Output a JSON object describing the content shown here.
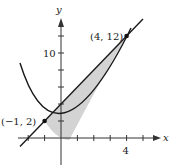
{
  "diagram": {
    "axes": {
      "x_label": "x",
      "y_label": "y"
    },
    "tick_labels": {
      "x": "4",
      "y": "10"
    },
    "points": [
      {
        "label": "(−1, 2)",
        "x": -1,
        "y": 2
      },
      {
        "label": "(4, 12)",
        "x": 4,
        "y": 12
      }
    ],
    "curves": [
      {
        "type": "parabola",
        "equation": "y = x^2 - x"
      },
      {
        "type": "line",
        "equation": "y = 2x + 4"
      }
    ],
    "shaded_region": "between line and parabola from x = -1 to x = 4",
    "colors": {
      "curve": "#1a1a1a",
      "shade": "#cfcfcf",
      "axis": "#333333"
    }
  }
}
